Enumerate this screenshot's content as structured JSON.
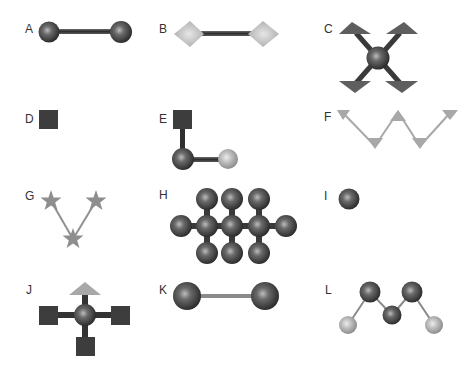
{
  "figure": {
    "background": "#ffffff",
    "colors": {
      "dark_sphere": "#4a4a4a",
      "light_sphere": "#b5b5b5",
      "dark_square": "#3d3d3d",
      "triangle_dark": "#5c5c5c",
      "triangle_light": "#a8a8a8",
      "diamond": "#bdbdbd",
      "star": "#8e8e8e",
      "bond_dark": "#3a3a3a",
      "bond_light": "#9a9a9a"
    },
    "panels": [
      {
        "id": "A",
        "label": "A",
        "description": "Two dark spheres joined by a dark bond"
      },
      {
        "id": "B",
        "label": "B",
        "description": "Two light gray diamonds joined by a dark bond"
      },
      {
        "id": "C",
        "label": "C",
        "description": "Central dark sphere with four diagonal bonds ending in dark triangles"
      },
      {
        "id": "D",
        "label": "D",
        "description": "Single dark square"
      },
      {
        "id": "E",
        "label": "E",
        "description": "Dark square bonded to dark sphere bonded to light sphere (L shape)"
      },
      {
        "id": "F",
        "label": "F",
        "description": "Zigzag chain of light gray triangles"
      },
      {
        "id": "G",
        "label": "G",
        "description": "Three gray stars in a V shape"
      },
      {
        "id": "H",
        "label": "H",
        "description": "Branched cluster of eleven dark spheres (3 center, 2 ends, 6 branches)"
      },
      {
        "id": "I",
        "label": "I",
        "description": "Single dark sphere"
      },
      {
        "id": "J",
        "label": "J",
        "description": "Central sphere with three dark squares and one light triangle"
      },
      {
        "id": "K",
        "label": "K",
        "description": "Two large dark spheres joined by a thin gray bond"
      },
      {
        "id": "L",
        "label": "L",
        "description": "Chain: light sphere, three dark spheres, light sphere in W shape"
      }
    ]
  }
}
